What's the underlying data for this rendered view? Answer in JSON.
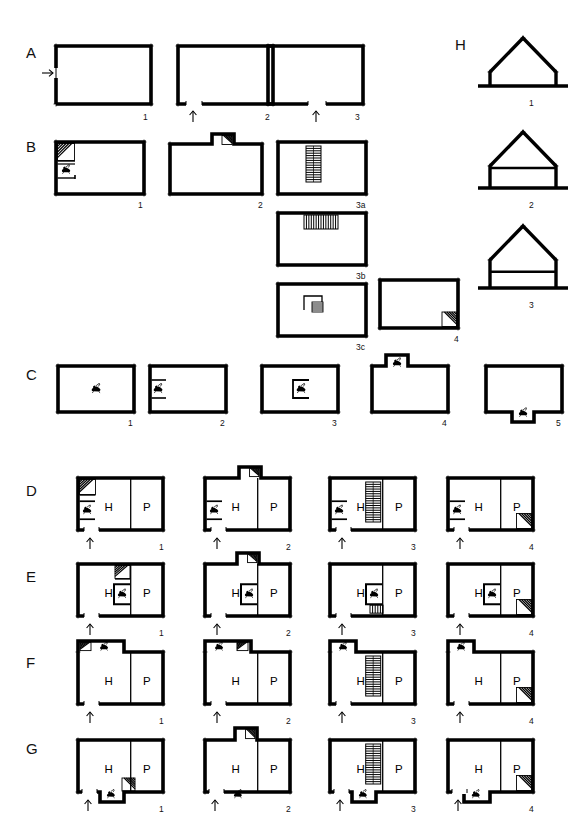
{
  "figure": {
    "canvas": {
      "width": 583,
      "height": 840,
      "background": "#ffffff",
      "ink": "#000000"
    },
    "room_labels": {
      "hall": "H",
      "parlour": "P"
    },
    "symbols": {
      "hearth": "hearth-icon",
      "winder_stair": "winder-stair-icon",
      "straight_stair": "straight-stair-icon",
      "entrance_arrow": "entrance-arrow-icon",
      "direction_arrow": "direction-arrow-icon"
    }
  },
  "rows": [
    {
      "id": "A",
      "label": "A",
      "caption": "Single-cell plan: position of entrance",
      "figures": [
        {
          "num": "1",
          "variant": "entry-left-side",
          "entrance": "left",
          "arrow": "left"
        },
        {
          "num": "2",
          "variant": "entry-bottom-left",
          "entrance": "bottom-left",
          "arrow": "up"
        },
        {
          "num": "3",
          "variant": "entry-bottom-mid",
          "entrance": "bottom-centre",
          "arrow": "up"
        }
      ]
    },
    {
      "id": "B",
      "label": "B",
      "caption": "Single-cell plan: position of stair",
      "figures": [
        {
          "num": "1",
          "variant": "winder-stair-left-with-hearth",
          "stair": "winder",
          "stair_pos": "left-wall"
        },
        {
          "num": "2",
          "variant": "stair-projection-top",
          "stair": "winder",
          "stair_pos": "top-projection"
        },
        {
          "num": "3a",
          "variant": "straight-stair-centre-vertical",
          "stair": "straight",
          "stair_pos": "centre-vertical"
        },
        {
          "num": "3b",
          "variant": "straight-stair-against-top",
          "stair": "straight",
          "stair_pos": "top-horizontal"
        },
        {
          "num": "3c",
          "variant": "dog-leg-stair-centre",
          "stair": "dog-leg",
          "stair_pos": "centre"
        },
        {
          "num": "4",
          "variant": "winder-stair-bottom-right",
          "stair": "winder",
          "stair_pos": "bottom-right-corner"
        }
      ]
    },
    {
      "id": "C",
      "label": "C",
      "caption": "Single-cell plan: position of hearth",
      "figures": [
        {
          "num": "1",
          "variant": "hearth-free-standing-centre",
          "hearth_pos": "centre"
        },
        {
          "num": "2",
          "variant": "hearth-against-left-wall",
          "hearth_pos": "left-wall"
        },
        {
          "num": "3",
          "variant": "hearth-internal-centre",
          "hearth_pos": "centre-enclosed"
        },
        {
          "num": "4",
          "variant": "hearth-top-projection",
          "hearth_pos": "top-projection"
        },
        {
          "num": "5",
          "variant": "hearth-bottom-projection",
          "hearth_pos": "bottom-projection"
        }
      ]
    },
    {
      "id": "D",
      "label": "D",
      "caption": "Two-cell hall and parlour: gable-end hearth",
      "figures": [
        {
          "num": "1",
          "hearth_pos": "left-wall",
          "stair": "winder",
          "stair_pos": "left-top-corner"
        },
        {
          "num": "2",
          "hearth_pos": "left-wall",
          "stair": "winder",
          "stair_pos": "top-projection"
        },
        {
          "num": "3",
          "hearth_pos": "left-wall",
          "stair": "straight",
          "stair_pos": "beside-partition"
        },
        {
          "num": "4",
          "hearth_pos": "left-wall",
          "stair": "winder",
          "stair_pos": "bottom-right-corner"
        }
      ]
    },
    {
      "id": "E",
      "label": "E",
      "caption": "Two-cell hall and parlour: axial internal hearth",
      "figures": [
        {
          "num": "1",
          "hearth_pos": "centre-axial",
          "stair": "winder",
          "stair_pos": "behind-hearth"
        },
        {
          "num": "2",
          "hearth_pos": "centre-axial",
          "stair": "winder",
          "stair_pos": "top-projection"
        },
        {
          "num": "3",
          "hearth_pos": "centre-axial",
          "stair": "dog-leg",
          "stair_pos": "beside-hearth"
        },
        {
          "num": "4",
          "hearth_pos": "centre-axial",
          "stair": "winder",
          "stair_pos": "bottom-right-corner"
        }
      ]
    },
    {
      "id": "F",
      "label": "F",
      "caption": "Two-cell plan with rear outshut / hearth in top-left wing",
      "figures": [
        {
          "num": "1",
          "hearth_pos": "top-left-wing",
          "stair": "winder",
          "stair_pos": "top-left-corner"
        },
        {
          "num": "2",
          "hearth_pos": "top-left-wing",
          "stair": "winder",
          "stair_pos": "top-projection"
        },
        {
          "num": "3",
          "hearth_pos": "top-left-wing",
          "stair": "straight",
          "stair_pos": "beside-partition"
        },
        {
          "num": "4",
          "hearth_pos": "top-left-wing",
          "stair": "winder",
          "stair_pos": "bottom-right-corner"
        }
      ]
    },
    {
      "id": "G",
      "label": "G",
      "caption": "Two-cell plan with front hearth projection",
      "figures": [
        {
          "num": "1",
          "hearth_pos": "bottom-projection",
          "stair": "winder",
          "stair_pos": "bottom-centre"
        },
        {
          "num": "2",
          "hearth_pos": "bottom-projection",
          "stair": "winder",
          "stair_pos": "top-projection"
        },
        {
          "num": "3",
          "hearth_pos": "bottom-projection",
          "stair": "straight",
          "stair_pos": "beside-partition"
        },
        {
          "num": "4",
          "hearth_pos": "bottom-projection",
          "stair": "winder",
          "stair_pos": "bottom-right-corner"
        }
      ]
    },
    {
      "id": "H",
      "label": "H",
      "caption": "Cross-sections: development of storey height",
      "orientation": "column",
      "figures": [
        {
          "num": "1",
          "variant": "single-storey-low-walls",
          "storeys": 1
        },
        {
          "num": "2",
          "variant": "storey-and-a-half",
          "storeys": 2
        },
        {
          "num": "3",
          "variant": "two-storey-full-height",
          "storeys": 2
        }
      ]
    }
  ]
}
